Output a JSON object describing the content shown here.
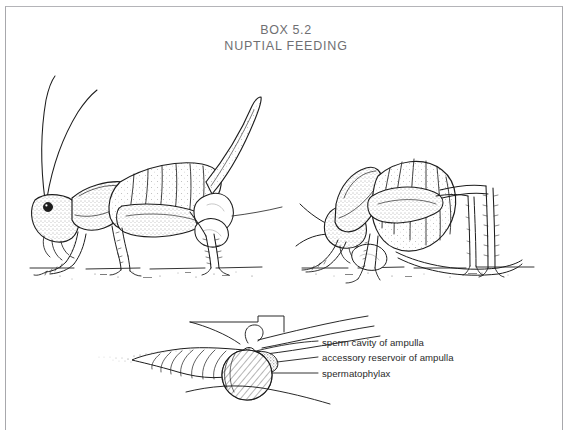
{
  "figure": {
    "box_number": "BOX 5.2",
    "box_title": "NUPTIAL FEEDING",
    "panels": [
      {
        "id": "left-panel",
        "name": "female-bush-cricket-with-spermatophore",
        "description": "Female bush-cricket standing on ground line, long antennae raised, sabre-shaped ovipositor curving upward, white bilobed spermatophore attached at tip of abdomen"
      },
      {
        "id": "right-panel",
        "name": "female-bush-cricket-eating-spermatophylax",
        "description": "Female bush-cricket curled head-down, feeding on the spermatophylax removed from the genital opening"
      },
      {
        "id": "bottom-panel",
        "name": "spermatophore-structure-diagram",
        "description": "Detail of spermatophore: feathered sperm-carrying ampulla tube at left, small ampulla with sperm cavity, stippled accessory reservoir, and large hatched spermatophylax sphere"
      }
    ],
    "callouts": [
      {
        "id": "sperm-cavity",
        "text": "sperm cavity of ampulla"
      },
      {
        "id": "accessory",
        "text": "accessory reservoir of ampulla"
      },
      {
        "id": "spermatophylax",
        "text": "spermatophylax"
      }
    ],
    "colors": {
      "page_background": "#ffffff",
      "ink": "#1d1d1d",
      "title_text": "#6f6f72",
      "label_text": "#2a2a2a",
      "border": "#a8a8ac",
      "stipple": "#4a4a4a"
    }
  }
}
